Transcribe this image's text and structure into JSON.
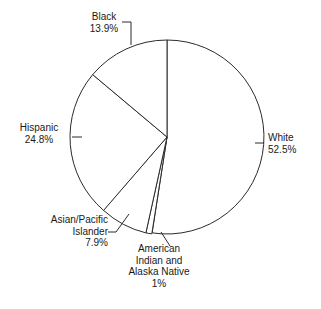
{
  "chart_data": {
    "type": "pie",
    "title": "",
    "subtitle": "",
    "xlabel": "",
    "ylabel": "",
    "legend_position": "none",
    "grid": false,
    "start_angle_deg": -90,
    "direction": "clockwise",
    "categories": [
      "White",
      "American Indian and Alaska Native",
      "Asian/Pacific Islander",
      "Hispanic",
      "Black"
    ],
    "values": [
      52.5,
      1,
      7.9,
      24.8,
      13.9
    ],
    "units": "percent",
    "slices": [
      {
        "key": "white",
        "name": "White",
        "percent_label": "52.5%",
        "value": 52.5,
        "color": "#ffffff",
        "stroke": "#2b2b2b"
      },
      {
        "key": "american_indian",
        "name_lines": [
          "American",
          "Indian and",
          "Alaska Native"
        ],
        "name": "American Indian and Alaska Native",
        "percent_label": "1%",
        "value": 1,
        "color": "#ffffff",
        "stroke": "#2b2b2b"
      },
      {
        "key": "asian_pacific",
        "name_lines": [
          "Asian/Pacific",
          "Islander"
        ],
        "name": "Asian/Pacific Islander",
        "percent_label": "7.9%",
        "value": 7.9,
        "color": "#ffffff",
        "stroke": "#2b2b2b"
      },
      {
        "key": "hispanic",
        "name": "Hispanic",
        "percent_label": "24.8%",
        "value": 24.8,
        "color": "#ffffff",
        "stroke": "#2b2b2b"
      },
      {
        "key": "black",
        "name": "Black",
        "percent_label": "13.9%",
        "value": 13.9,
        "color": "#ffffff",
        "stroke": "#2b2b2b"
      }
    ],
    "labels": {
      "black": {
        "name": "Black",
        "percent": "13.9%"
      },
      "white": {
        "name": "White",
        "percent": "52.5%"
      },
      "hispanic": {
        "name": "Hispanic",
        "percent": "24.8%"
      },
      "asian_line1": "Asian/Pacific",
      "asian_line2": "Islander",
      "asian_percent": "7.9%",
      "amind_line1": "American",
      "amind_line2": "Indian and",
      "amind_line3": "Alaska Native",
      "amind_percent": "1%"
    },
    "style": {
      "background": "#ffffff",
      "outline": "#2b2b2b",
      "text": "#1a1a1a"
    },
    "geometry": {
      "center_x": 167,
      "center_y": 137,
      "radius": 97
    }
  }
}
